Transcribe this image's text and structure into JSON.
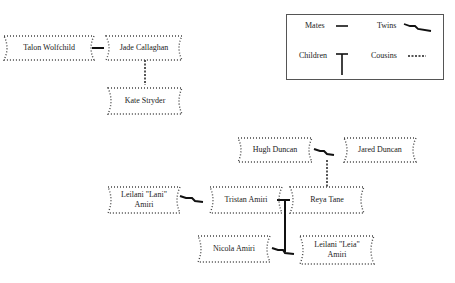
{
  "legend": {
    "mates": "Mates",
    "twins": "Twins",
    "children": "Children",
    "cousins": "Cousins"
  },
  "people": {
    "talon": "Talon Wolfchild",
    "jade": "Jade Callaghan",
    "kate": "Kate Stryder",
    "hugh": "Hugh Duncan",
    "jared": "Jared Duncan",
    "lani": "Leilani \"Lani\" Amiri",
    "tristan": "Tristan Amiri",
    "reya": "Reya Tane",
    "nicola": "Nicola Amiri",
    "leia": "Leilani \"Leia\" Amiri"
  },
  "relationships": [
    {
      "type": "mates",
      "a": "Talon Wolfchild",
      "b": "Jade Callaghan"
    },
    {
      "type": "cousins",
      "a": "Jade Callaghan",
      "b": "Kate Stryder"
    },
    {
      "type": "twins",
      "a": "Hugh Duncan",
      "b": "Jared Duncan"
    },
    {
      "type": "cousins",
      "a": "Hugh Duncan",
      "b": "Reya Tane"
    },
    {
      "type": "twins",
      "a": "Leilani \"Lani\" Amiri",
      "b": "Tristan Amiri"
    },
    {
      "type": "mates",
      "a": "Tristan Amiri",
      "b": "Reya Tane"
    },
    {
      "type": "children",
      "parents": [
        "Tristan Amiri",
        "Reya Tane"
      ],
      "children": [
        "Nicola Amiri",
        "Leilani \"Leia\" Amiri"
      ]
    },
    {
      "type": "twins",
      "a": "Nicola Amiri",
      "b": "Leilani \"Leia\" Amiri"
    }
  ]
}
